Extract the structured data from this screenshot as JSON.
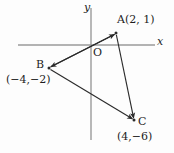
{
  "figure": {
    "type": "coordinate-plane-triangle",
    "width": 174,
    "height": 153,
    "background_color": "#fdfdfd",
    "axis_color": "#9a9a9a",
    "line_color": "#2b2b2b",
    "text_color": "#1d1d1d"
  },
  "axes": {
    "x_label": "x",
    "y_label": "y",
    "origin_label": "O",
    "origin_px": {
      "x": 91,
      "y": 45
    },
    "x_axis_px": {
      "x1": 18,
      "y1": 45,
      "x2": 155,
      "y2": 45
    },
    "y_axis_px": {
      "x1": 91,
      "y1": 8,
      "x2": 91,
      "y2": 140
    }
  },
  "points": {
    "a": {
      "name": "A",
      "label": "A(2, 1)",
      "coords": [
        2,
        1
      ],
      "px": {
        "x": 116,
        "y": 33
      }
    },
    "b": {
      "name": "B",
      "label": "B",
      "coord_label": "(−4,−2)",
      "coords": [
        -4,
        -2
      ],
      "px": {
        "x": 49,
        "y": 68
      }
    },
    "c": {
      "name": "C",
      "label": "C",
      "coord_label": "(4,−6)",
      "coords": [
        4,
        -6
      ],
      "px": {
        "x": 134,
        "y": 120
      }
    }
  },
  "segments": [
    {
      "name": "segment-ba",
      "from": "B",
      "to": "A",
      "arrow_at": "A"
    },
    {
      "name": "segment-ab",
      "from": "A",
      "to": "B",
      "arrow_at": "B"
    },
    {
      "name": "segment-bc",
      "from": "B",
      "to": "C",
      "arrow_at": "C"
    },
    {
      "name": "segment-ac",
      "from": "A",
      "to": "C",
      "arrow_at": "C"
    }
  ]
}
